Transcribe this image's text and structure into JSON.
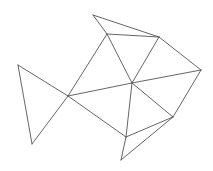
{
  "diagram": {
    "stroke_color": "#555555",
    "background": "#ffffff",
    "vertices": {
      "A": [
        93,
        15
      ],
      "B": [
        107,
        34
      ],
      "C": [
        159,
        37
      ],
      "D": [
        201,
        70
      ],
      "E": [
        132,
        83
      ],
      "F": [
        68,
        96
      ],
      "G": [
        18,
        65
      ],
      "H": [
        32,
        144
      ],
      "I": [
        173,
        117
      ],
      "J": [
        126,
        137
      ],
      "K": [
        121,
        160
      ]
    },
    "edges": [
      [
        "A",
        "B"
      ],
      [
        "A",
        "C"
      ],
      [
        "B",
        "C"
      ],
      [
        "B",
        "E"
      ],
      [
        "C",
        "E"
      ],
      [
        "C",
        "D"
      ],
      [
        "B",
        "F"
      ],
      [
        "F",
        "E"
      ],
      [
        "E",
        "D"
      ],
      [
        "G",
        "F"
      ],
      [
        "G",
        "H"
      ],
      [
        "H",
        "F"
      ],
      [
        "F",
        "J"
      ],
      [
        "E",
        "J"
      ],
      [
        "E",
        "I"
      ],
      [
        "D",
        "I"
      ],
      [
        "I",
        "J"
      ],
      [
        "I",
        "K"
      ],
      [
        "J",
        "K"
      ]
    ]
  }
}
